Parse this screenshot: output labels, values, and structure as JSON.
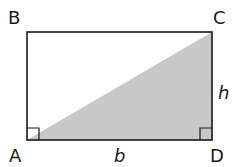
{
  "diagram": {
    "type": "rectangle-with-diagonal-triangle",
    "vertices": [
      {
        "label": "A",
        "position": "bottom-left"
      },
      {
        "label": "B",
        "position": "top-left"
      },
      {
        "label": "C",
        "position": "top-right"
      },
      {
        "label": "D",
        "position": "bottom-right"
      }
    ],
    "dimensions": {
      "base_label": "b",
      "height_label": "h"
    },
    "shaded_region": {
      "vertices": [
        "A",
        "C",
        "D"
      ],
      "color": "#c8c8c8"
    },
    "right_angle_markers": [
      "A",
      "D"
    ],
    "colors": {
      "stroke": "#1a1a1a",
      "fill": "#c8c8c8",
      "background": "#ffffff"
    }
  }
}
